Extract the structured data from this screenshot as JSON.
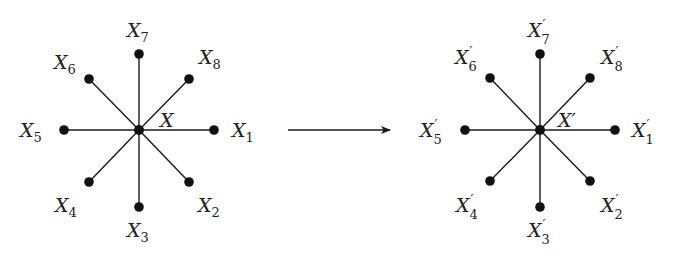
{
  "diagram": {
    "left_star": {
      "center": {
        "x": 139,
        "y": 130,
        "label": "X"
      },
      "nodes": [
        {
          "id": "X1",
          "label": "X",
          "sub": "1",
          "prime": false,
          "x": 214,
          "y": 130,
          "lx": 232,
          "ly": 137
        },
        {
          "id": "X2",
          "label": "X",
          "sub": "2",
          "prime": false,
          "x": 189,
          "y": 182,
          "lx": 198,
          "ly": 212
        },
        {
          "id": "X3",
          "label": "X",
          "sub": "3",
          "prime": false,
          "x": 139,
          "y": 207,
          "lx": 127,
          "ly": 237
        },
        {
          "id": "X4",
          "label": "X",
          "sub": "4",
          "prime": false,
          "x": 89,
          "y": 182,
          "lx": 55,
          "ly": 212
        },
        {
          "id": "X5",
          "label": "X",
          "sub": "5",
          "prime": false,
          "x": 64,
          "y": 130,
          "lx": 20,
          "ly": 137
        },
        {
          "id": "X6",
          "label": "X",
          "sub": "6",
          "prime": false,
          "x": 89,
          "y": 79,
          "lx": 54,
          "ly": 69
        },
        {
          "id": "X7",
          "label": "X",
          "sub": "7",
          "prime": false,
          "x": 139,
          "y": 54,
          "lx": 127,
          "ly": 37
        },
        {
          "id": "X8",
          "label": "X",
          "sub": "8",
          "prime": false,
          "x": 189,
          "y": 79,
          "lx": 199,
          "ly": 64
        }
      ],
      "center_label_pos": {
        "x": 160,
        "y": 127
      }
    },
    "right_star": {
      "center": {
        "x": 540,
        "y": 130,
        "label": "X′"
      },
      "nodes": [
        {
          "id": "X1p",
          "label": "X",
          "sub": "1",
          "prime": true,
          "x": 615,
          "y": 130,
          "lx": 632,
          "ly": 137
        },
        {
          "id": "X2p",
          "label": "X",
          "sub": "2",
          "prime": true,
          "x": 590,
          "y": 181,
          "lx": 601,
          "ly": 212
        },
        {
          "id": "X3p",
          "label": "X",
          "sub": "3",
          "prime": true,
          "x": 540,
          "y": 207,
          "lx": 528,
          "ly": 237
        },
        {
          "id": "X4p",
          "label": "X",
          "sub": "4",
          "prime": true,
          "x": 490,
          "y": 181,
          "lx": 456,
          "ly": 212
        },
        {
          "id": "X5p",
          "label": "X",
          "sub": "5",
          "prime": true,
          "x": 465,
          "y": 130,
          "lx": 420,
          "ly": 137
        },
        {
          "id": "X6p",
          "label": "X",
          "sub": "6",
          "prime": true,
          "x": 490,
          "y": 78,
          "lx": 455,
          "ly": 64
        },
        {
          "id": "X7p",
          "label": "X",
          "sub": "7",
          "prime": true,
          "x": 540,
          "y": 54,
          "lx": 528,
          "ly": 37
        },
        {
          "id": "X8p",
          "label": "X",
          "sub": "8",
          "prime": true,
          "x": 590,
          "y": 78,
          "lx": 601,
          "ly": 64
        }
      ],
      "center_label_pos": {
        "x": 558,
        "y": 127
      }
    },
    "arrow": {
      "x1": 288,
      "y1": 130,
      "x2": 390,
      "y2": 130
    },
    "colors": {
      "stroke": "#1a1a1a",
      "node": "#111111",
      "text": "#222222"
    }
  }
}
